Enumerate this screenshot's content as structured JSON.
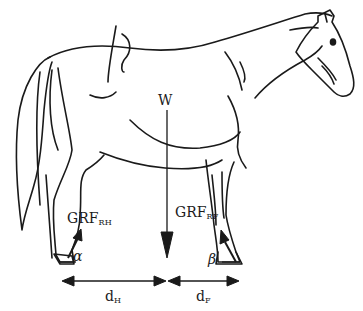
{
  "figure": {
    "stroke_color": "#1a1a1a",
    "background": "#ffffff"
  },
  "labels": {
    "weight": "W",
    "grf_rear": {
      "main": "GRF",
      "sub": "RH"
    },
    "grf_front": {
      "main": "GRF",
      "sub": "RF"
    },
    "angle_rear": "α",
    "angle_front": "β",
    "dist_hind": {
      "main": "d",
      "sub": "H"
    },
    "dist_fore": {
      "main": "d",
      "sub": "F"
    }
  },
  "vectors": {
    "weight_arrow": {
      "direction": "down",
      "x": 167,
      "y_start": 110,
      "y_end": 258
    },
    "grf_rear_arrow": {
      "direction": "up-right",
      "from": [
        68,
        257
      ],
      "to": [
        80,
        231
      ]
    },
    "grf_front_arrow": {
      "direction": "up-left",
      "from": [
        236,
        262
      ],
      "to": [
        222,
        234
      ]
    },
    "dim_hind": {
      "x_start": 62,
      "x_end": 165,
      "y": 282
    },
    "dim_fore": {
      "x_start": 168,
      "x_end": 238,
      "y": 282
    }
  }
}
